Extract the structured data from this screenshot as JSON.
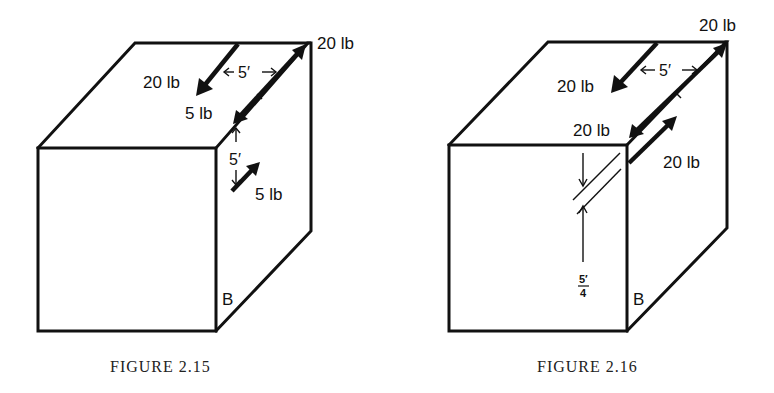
{
  "figures": [
    {
      "caption": "FIGURE 2.15",
      "corner_label": "B",
      "forces": [
        {
          "label": "20 lb",
          "location": "top-face arrow pointing toward front"
        },
        {
          "label": "20 lb",
          "location": "back-top-right corner, along top-right edge"
        },
        {
          "label": "5 lb",
          "location": "front-top-right corner, along top-right edge"
        },
        {
          "label": "5 lb",
          "location": "right face, arrow pointing up-right"
        }
      ],
      "dimensions": [
        {
          "label": "5′",
          "location": "horizontal spacing on top face"
        },
        {
          "label": "5′",
          "location": "vertical spacing on right face"
        }
      ],
      "labels": {
        "top_right": "20 lb",
        "top_arrow": "20 lb",
        "edge_lower": "5 lb",
        "right_face": "5 lb",
        "dim_top": "5′",
        "dim_side": "5′"
      }
    },
    {
      "caption": "FIGURE 2.16",
      "corner_label": "B",
      "forces": [
        {
          "label": "20 lb",
          "location": "top-face arrow pointing toward front"
        },
        {
          "label": "20 lb",
          "location": "back-top-right corner, along top-right edge"
        },
        {
          "label": "20 lb",
          "location": "front-top-right corner, along top-right edge"
        },
        {
          "label": "20 lb",
          "location": "right face, arrow pointing up-right"
        }
      ],
      "dimensions": [
        {
          "label": "5′",
          "location": "horizontal spacing on top face"
        },
        {
          "label": "5′/4",
          "location": "vertical offset on front face"
        }
      ],
      "labels": {
        "top_right": "20 lb",
        "top_arrow": "20 lb",
        "edge_lower": "20 lb",
        "right_face": "20 lb",
        "dim_top": "5′",
        "frac_num": "5′",
        "frac_den": "4"
      }
    }
  ]
}
